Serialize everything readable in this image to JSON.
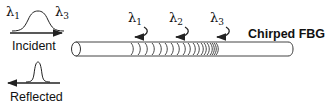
{
  "diagram": {
    "title": "Chirped FBG",
    "incident": {
      "label": "Incident",
      "left_symbol": "λ",
      "left_sub": "1",
      "right_symbol": "λ",
      "right_sub": "3"
    },
    "reflected": {
      "label": "Reflected"
    },
    "reflection_points": [
      {
        "symbol": "λ",
        "sub": "1"
      },
      {
        "symbol": "λ",
        "sub": "2"
      },
      {
        "symbol": "λ",
        "sub": "3"
      }
    ],
    "colors": {
      "stroke": "#222222",
      "text": "#111111",
      "background": "#ffffff"
    }
  }
}
